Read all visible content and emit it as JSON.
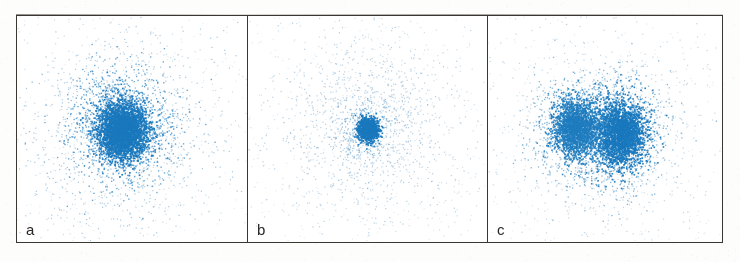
{
  "figure": {
    "background_color": "#fdfdfc",
    "panel_background_color": "#ffffff",
    "border_color": "#3a3632",
    "point_color_core": "#1a78bd",
    "point_color_halo": "#5a9fd4",
    "point_color_sparse": "#9ab9cf",
    "label_color": "#2b2724",
    "width": 740,
    "height": 262
  },
  "chart_data": {
    "type": "scatter",
    "title": "",
    "subtitle": "",
    "xlabel": "",
    "ylabel": "",
    "grid": false,
    "axes_visible": false,
    "tick_labels": [],
    "legend": [],
    "legend_position": "none",
    "xlim": [
      0,
      1
    ],
    "ylim": [
      0,
      1
    ],
    "panel_count": 3,
    "panels": [
      {
        "label": "a",
        "width_px": 230,
        "clusters": [
          {
            "name": "core",
            "cx": 0.455,
            "cy": 0.505,
            "sigma_x": 0.052,
            "sigma_y": 0.062,
            "n_points": 2600,
            "dot_size": 1.7,
            "color": "#1a78bd",
            "opacity": 0.95
          },
          {
            "name": "inner-halo",
            "cx": 0.455,
            "cy": 0.5,
            "sigma_x": 0.105,
            "sigma_y": 0.115,
            "n_points": 1500,
            "dot_size": 1.35,
            "color": "#2f86c4",
            "opacity": 0.75
          },
          {
            "name": "outer-halo",
            "cx": 0.455,
            "cy": 0.5,
            "sigma_x": 0.2,
            "sigma_y": 0.215,
            "n_points": 900,
            "dot_size": 1.2,
            "color": "#6ba3cc",
            "opacity": 0.6
          },
          {
            "name": "diffuse-field",
            "cx": 0.47,
            "cy": 0.5,
            "sigma_x": 0.34,
            "sigma_y": 0.33,
            "n_points": 520,
            "dot_size": 1.15,
            "color": "#93b4ca",
            "opacity": 0.5
          }
        ],
        "background_noise": {
          "n_points": 210,
          "dot_size": 1.1,
          "color": "#b9c8d4",
          "opacity": 0.42
        },
        "seed": 11
      },
      {
        "label": "b",
        "width_px": 240,
        "clusters": [
          {
            "name": "core",
            "cx": 0.5,
            "cy": 0.5,
            "sigma_x": 0.022,
            "sigma_y": 0.026,
            "n_points": 900,
            "dot_size": 1.7,
            "color": "#1a78bd",
            "opacity": 0.95
          },
          {
            "name": "inner-halo",
            "cx": 0.5,
            "cy": 0.5,
            "sigma_x": 0.062,
            "sigma_y": 0.07,
            "n_points": 260,
            "dot_size": 1.25,
            "color": "#4b95c8",
            "opacity": 0.6
          },
          {
            "name": "ring-halo",
            "cx": 0.5,
            "cy": 0.49,
            "sigma_x": 0.175,
            "sigma_y": 0.19,
            "n_points": 900,
            "dot_size": 1.2,
            "color": "#7fadd0",
            "opacity": 0.58
          },
          {
            "name": "diffuse-field",
            "cx": 0.5,
            "cy": 0.49,
            "sigma_x": 0.3,
            "sigma_y": 0.305,
            "n_points": 620,
            "dot_size": 1.15,
            "color": "#9dbbce",
            "opacity": 0.5
          }
        ],
        "background_noise": {
          "n_points": 230,
          "dot_size": 1.1,
          "color": "#bbc9d4",
          "opacity": 0.42
        },
        "seed": 23
      },
      {
        "label": "c",
        "width_px": 235,
        "clusters": [
          {
            "name": "core-left",
            "cx": 0.375,
            "cy": 0.495,
            "sigma_x": 0.048,
            "sigma_y": 0.062,
            "n_points": 1900,
            "dot_size": 1.6,
            "color": "#1f7cbf",
            "opacity": 0.9
          },
          {
            "name": "core-right",
            "cx": 0.565,
            "cy": 0.52,
            "sigma_x": 0.052,
            "sigma_y": 0.07,
            "n_points": 2300,
            "dot_size": 1.65,
            "color": "#1a78bd",
            "opacity": 0.93
          },
          {
            "name": "halo-left",
            "cx": 0.375,
            "cy": 0.495,
            "sigma_x": 0.095,
            "sigma_y": 0.115,
            "n_points": 900,
            "dot_size": 1.3,
            "color": "#4d96c8",
            "opacity": 0.7
          },
          {
            "name": "halo-right",
            "cx": 0.565,
            "cy": 0.52,
            "sigma_x": 0.1,
            "sigma_y": 0.125,
            "n_points": 1000,
            "dot_size": 1.3,
            "color": "#4d96c8",
            "opacity": 0.7
          },
          {
            "name": "outer-field",
            "cx": 0.475,
            "cy": 0.5,
            "sigma_x": 0.24,
            "sigma_y": 0.26,
            "n_points": 820,
            "dot_size": 1.18,
            "color": "#8cb2cd",
            "opacity": 0.55
          }
        ],
        "background_noise": {
          "n_points": 250,
          "dot_size": 1.1,
          "color": "#b6c6d3",
          "opacity": 0.42
        },
        "seed": 37
      }
    ]
  }
}
